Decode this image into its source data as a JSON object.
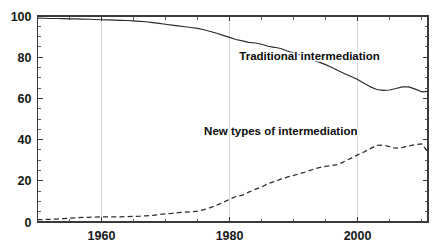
{
  "chart_data": {
    "type": "line",
    "title": "",
    "subtitle": "",
    "xlabel": "",
    "ylabel": "",
    "xlim": [
      1950,
      2011
    ],
    "ylim": [
      0,
      100
    ],
    "grid": "vertical gridlines at major x ticks only",
    "legend_position": "inline labels on plot",
    "x_ticks_major": [
      1960,
      1980,
      2000
    ],
    "x_tick_labels": [
      "1960",
      "1980",
      "2000"
    ],
    "x_ticks_minor": [
      1955,
      1965,
      1970,
      1975,
      1985,
      1990,
      1995,
      2005,
      2010
    ],
    "y_ticks_major": [
      0,
      20,
      40,
      60,
      80,
      100
    ],
    "y_tick_labels": [
      "0",
      "20",
      "40",
      "60",
      "80",
      "100"
    ],
    "y_ticks_minor": [
      5,
      10,
      15,
      25,
      30,
      35,
      45,
      50,
      55,
      65,
      70,
      75,
      85,
      90,
      95
    ],
    "series": [
      {
        "name": "Traditional intermediation",
        "style": "solid",
        "label_x": 1992.5,
        "label_y": 78.5,
        "x": [
          1950,
          1951,
          1952,
          1953,
          1954,
          1955,
          1956,
          1957,
          1958,
          1959,
          1960,
          1961,
          1962,
          1963,
          1964,
          1965,
          1966,
          1967,
          1968,
          1969,
          1970,
          1971,
          1972,
          1973,
          1974,
          1975,
          1976,
          1977,
          1978,
          1979,
          1980,
          1981,
          1982,
          1983,
          1984,
          1985,
          1986,
          1987,
          1988,
          1989,
          1990,
          1991,
          1992,
          1993,
          1994,
          1995,
          1996,
          1997,
          1998,
          1999,
          2000,
          2001,
          2002,
          2003,
          2004,
          2005,
          2006,
          2007,
          2008,
          2009,
          2010,
          2011
        ],
        "values": [
          99.0,
          98.9,
          98.8,
          98.8,
          98.7,
          98.6,
          98.6,
          98.5,
          98.4,
          98.3,
          98.2,
          98.1,
          98.0,
          97.9,
          97.8,
          97.6,
          97.4,
          97.2,
          96.8,
          96.4,
          96.0,
          95.6,
          95.2,
          94.8,
          94.4,
          94.0,
          93.3,
          92.5,
          91.6,
          90.6,
          89.6,
          88.6,
          87.9,
          87.2,
          86.9,
          86.3,
          85.3,
          84.8,
          84.2,
          83.0,
          82.1,
          81.1,
          79.9,
          78.7,
          77.6,
          76.4,
          75.0,
          73.4,
          72.0,
          70.6,
          69.2,
          67.4,
          65.6,
          64.3,
          63.9,
          64.1,
          64.8,
          65.6,
          65.6,
          64.5,
          63.2,
          63.4
        ],
        "values_tail_note": "rises at very end to about 70",
        "end_values": [
          1950,
          99.0,
          2011,
          70.0
        ]
      },
      {
        "name": "New types of intermediation",
        "style": "dashed",
        "label_x": 1988.0,
        "label_y": 42.0,
        "x": [
          1950,
          1951,
          1952,
          1953,
          1954,
          1955,
          1956,
          1957,
          1958,
          1959,
          1960,
          1961,
          1962,
          1963,
          1964,
          1965,
          1966,
          1967,
          1968,
          1969,
          1970,
          1971,
          1972,
          1973,
          1974,
          1975,
          1976,
          1977,
          1978,
          1979,
          1980,
          1981,
          1982,
          1983,
          1984,
          1985,
          1986,
          1987,
          1988,
          1989,
          1990,
          1991,
          1992,
          1993,
          1994,
          1995,
          1996,
          1997,
          1998,
          1999,
          2000,
          2001,
          2002,
          2003,
          2004,
          2005,
          2006,
          2007,
          2008,
          2009,
          2010,
          2011
        ],
        "values": [
          1.1,
          1.2,
          1.3,
          1.4,
          1.6,
          1.8,
          2.0,
          2.2,
          2.3,
          2.4,
          2.5,
          2.5,
          2.5,
          2.5,
          2.6,
          2.7,
          2.8,
          3.0,
          3.2,
          3.6,
          4.0,
          4.2,
          4.5,
          4.8,
          5.0,
          5.3,
          6.0,
          7.0,
          8.2,
          9.5,
          11.0,
          12.4,
          13.0,
          14.5,
          15.8,
          17.0,
          18.6,
          19.6,
          20.8,
          21.8,
          22.6,
          23.5,
          24.4,
          25.5,
          26.4,
          27.0,
          27.4,
          28.0,
          29.5,
          31.0,
          32.6,
          34.0,
          35.6,
          37.2,
          37.4,
          36.6,
          35.8,
          36.2,
          36.9,
          37.6,
          37.9,
          34.0
        ],
        "end_values": [
          1950,
          1.1,
          2011,
          32.0
        ]
      }
    ]
  },
  "axes": {
    "left_spine": true,
    "right_spine": true,
    "top_spine": true,
    "bottom_spine": true,
    "tick_direction": "inward"
  },
  "colors": {
    "background": "#ffffff",
    "axis": "#3a3a3a",
    "gridline": "#cfcfcf",
    "series_line": "#2b2b2b",
    "text": "#0d0d0d"
  }
}
